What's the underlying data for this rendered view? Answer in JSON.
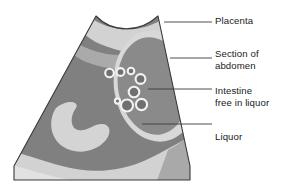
{
  "figure": {
    "background_color": "#ffffff"
  },
  "colors": {
    "liquor_dark": "#808080",
    "tissue_light": "#d2d2d2",
    "tissue_mid": "#a8a8a8",
    "tissue_pale": "#e0e0e0",
    "outline": "#3a3a3a",
    "circle_stroke": "#f2f2f2",
    "circle_fill": "#707070",
    "leader_line": "#3a3a3a",
    "label_text": "#1a1a1a"
  },
  "labels": [
    {
      "id": "placenta",
      "text": "Placenta"
    },
    {
      "id": "section",
      "text": "Section of\nabdomen"
    },
    {
      "id": "intestine",
      "text": "Intestine\nfree in liquor"
    },
    {
      "id": "liquor",
      "text": "Liquor"
    }
  ],
  "regions": [
    {
      "name": "scan-sector",
      "description": "Ultrasound sector scan outline, concave top arc, splayed trapezoid body"
    },
    {
      "name": "placenta-region",
      "description": "Pale band along upper and right margin of the scan"
    },
    {
      "name": "abdomen-section",
      "description": "Large oval cross-section of fetal abdomen on right, pale rim"
    },
    {
      "name": "liquor-region",
      "description": "Dark grey amniotic fluid filling the sector"
    },
    {
      "name": "bowel-loop",
      "description": "Pale bean shaped structure lower left"
    },
    {
      "name": "lower-band",
      "description": "Pale curved band across the bottom of the sector"
    }
  ],
  "intestine_circles": [
    {
      "cx": 109.5,
      "cy": 73.0,
      "r": 4.3
    },
    {
      "cx": 120.5,
      "cy": 72.0,
      "r": 3.9
    },
    {
      "cx": 131.0,
      "cy": 71.0,
      "r": 3.3
    },
    {
      "cx": 140.5,
      "cy": 79.0,
      "r": 4.9
    },
    {
      "cx": 134.0,
      "cy": 92.0,
      "r": 5.3
    },
    {
      "cx": 141.5,
      "cy": 104.5,
      "r": 5.6
    },
    {
      "cx": 127.0,
      "cy": 105.5,
      "r": 6.0
    },
    {
      "cx": 117.5,
      "cy": 101.0,
      "r": 2.6
    }
  ],
  "leader_lines": [
    {
      "for": "placenta",
      "x1": 164,
      "y1": 22,
      "x2": 212,
      "y2": 22
    },
    {
      "for": "section",
      "x1": 170,
      "y1": 58,
      "x2": 212,
      "y2": 58
    },
    {
      "for": "intestine",
      "x1": 148,
      "y1": 89,
      "x2": 212,
      "y2": 89
    },
    {
      "for": "liquor",
      "x1": 142,
      "y1": 124,
      "x2": 212,
      "y2": 124
    }
  ]
}
